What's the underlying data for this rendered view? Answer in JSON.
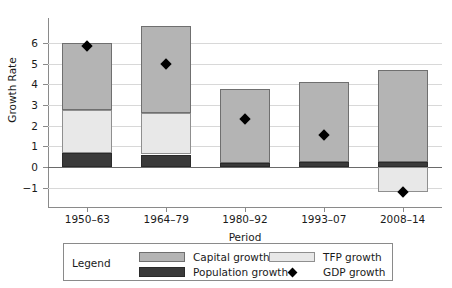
{
  "chart_data": {
    "type": "bar",
    "subtype": "stacked-bar-with-scatter-overlay",
    "title": "",
    "xlabel": "Period",
    "ylabel": "Growth Rate",
    "categories": [
      "1950–63",
      "1964–79",
      "1980–92",
      "1993–07",
      "2008–14"
    ],
    "ylim": [
      -1.6,
      7.2
    ],
    "yticks": [
      -1,
      0,
      1,
      2,
      3,
      4,
      5,
      6
    ],
    "ytick_labels": [
      "−1",
      "0",
      "1",
      "2",
      "3",
      "4",
      "5",
      "6"
    ],
    "grid": true,
    "grid_axis": "y",
    "legend_position": "below-axes",
    "legend_title": "Legend",
    "series": [
      {
        "name": "Population growth",
        "color": "#3a3a3a",
        "values": [
          0.65,
          0.6,
          0.2,
          0.25,
          0.25
        ]
      },
      {
        "name": "TFP growth",
        "color": "#e8e8e8",
        "values": [
          2.1,
          2.0,
          0.0,
          0.0,
          -1.2
        ]
      },
      {
        "name": "Capital growth",
        "color": "#b4b4b4",
        "values": [
          3.25,
          4.2,
          3.55,
          3.85,
          4.45
        ]
      }
    ],
    "overlay": {
      "name": "GDP growth",
      "marker": "diamond",
      "color": "#000000",
      "values": [
        5.85,
        5.0,
        2.3,
        1.55,
        -1.2
      ]
    },
    "bar_totals_positive": [
      6.0,
      6.8,
      3.75,
      4.1,
      4.7
    ],
    "bar_totals_negative": [
      0,
      0,
      0,
      0,
      -1.2
    ]
  },
  "axis": {
    "y_title": "Growth Rate",
    "x_title": "Period"
  },
  "legend": {
    "title": "Legend",
    "entries": [
      {
        "label": "Capital growth",
        "swatch": "capital-swatch"
      },
      {
        "label": "TFP growth",
        "swatch": "tfp-swatch"
      },
      {
        "label": "Population growth",
        "swatch": "population-swatch"
      },
      {
        "label": "GDP growth",
        "swatch": "gdp-diamond-marker"
      }
    ]
  }
}
